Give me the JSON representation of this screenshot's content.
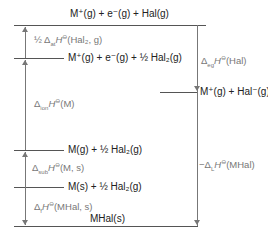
{
  "levels": [
    {
      "id": "top",
      "label": "M⁺(g) + e⁻(g) + Hal(g)"
    },
    {
      "id": "l2",
      "label": "M⁺(g) + e⁻(g) + ½ Hal₂(g)"
    },
    {
      "id": "right",
      "label": "M⁺(g) + Hal⁻(g)"
    },
    {
      "id": "l3",
      "label": "M(g) + ½ Hal₂(g)"
    },
    {
      "id": "l4",
      "label": "M(s) + ½ Hal₂(g)"
    },
    {
      "id": "bottom",
      "label": "MHal(s)"
    }
  ],
  "steps": [
    {
      "id": "atomisation_hal",
      "prefix": "½ Δ",
      "sub": "at",
      "main": "H",
      "sup": "⊖",
      "suffix": "(Hal₂, g)"
    },
    {
      "id": "ionisation",
      "prefix": "Δ",
      "sub": "ion",
      "main": "H",
      "sup": "⊖",
      "suffix": "(M)"
    },
    {
      "id": "sublimation",
      "prefix": "Δ",
      "sub": "sub",
      "main": "H",
      "sup": "⊖",
      "suffix": "(M, s)"
    },
    {
      "id": "formation",
      "prefix": "Δ",
      "sub": "f",
      "main": "H",
      "sup": "⊖",
      "suffix": "(MHal, s)"
    },
    {
      "id": "electron_gain",
      "prefix": "Δ",
      "sub": "eg",
      "main": "H",
      "sup": "⊖",
      "suffix": "(Hal)"
    },
    {
      "id": "lattice",
      "prefix": "−Δ",
      "sub": "L",
      "main": "H",
      "sup": "⊖",
      "suffix": "(MHal)"
    }
  ]
}
